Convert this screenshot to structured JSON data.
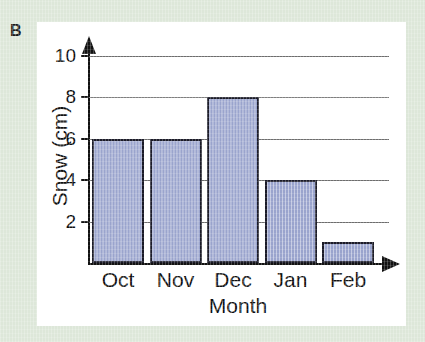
{
  "figure": {
    "panel_letter": "B",
    "background_color": "#dde7d9",
    "card_color": "#ffffff"
  },
  "chart_data": {
    "type": "bar",
    "title": "",
    "subtitle": "",
    "categories": [
      "Oct",
      "Nov",
      "Dec",
      "Jan",
      "Feb"
    ],
    "values": [
      6,
      6,
      8,
      4,
      1
    ],
    "xlabel": "Month",
    "ylabel": "Snow (cm)",
    "ylim": [
      0,
      10
    ],
    "ytick_values": [
      2,
      4,
      6,
      8,
      10
    ],
    "ytick_labels": [
      "2",
      "4",
      "6",
      "8",
      "10"
    ],
    "grid": true,
    "grid_axis": "y",
    "legend": false,
    "legend_position": "none",
    "bar_fill_color": "#9aa4cd",
    "bar_edge_color": "#1b1b28",
    "gridline_color": "#6d6d6d",
    "axis_color": "#111111",
    "annotations": []
  }
}
